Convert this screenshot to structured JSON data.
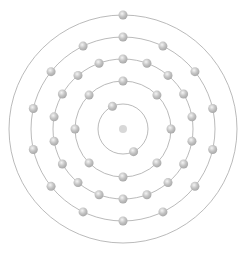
{
  "diagram": {
    "type": "bohr-model",
    "center": [
      123,
      129
    ],
    "nucleus": {
      "radius": 4,
      "color": "#d8d8d8"
    },
    "orbit_color": "#a8a8a8",
    "electron_color": "#bdbdbd",
    "electron_highlight": "#f2f2f2",
    "electron_radius": 4.5,
    "shells": [
      {
        "radius": 25,
        "electrons": 2,
        "start_angle": -115
      },
      {
        "radius": 48,
        "electrons": 8,
        "start_angle": -90
      },
      {
        "radius": 70,
        "electrons": 18,
        "start_angle": -90
      },
      {
        "radius": 92,
        "electrons": 14,
        "start_angle": -90
      },
      {
        "radius": 114,
        "electrons": 1,
        "start_angle": -90
      }
    ],
    "electron_configuration": [
      2,
      8,
      18,
      14,
      1
    ],
    "total_electrons": 43
  }
}
